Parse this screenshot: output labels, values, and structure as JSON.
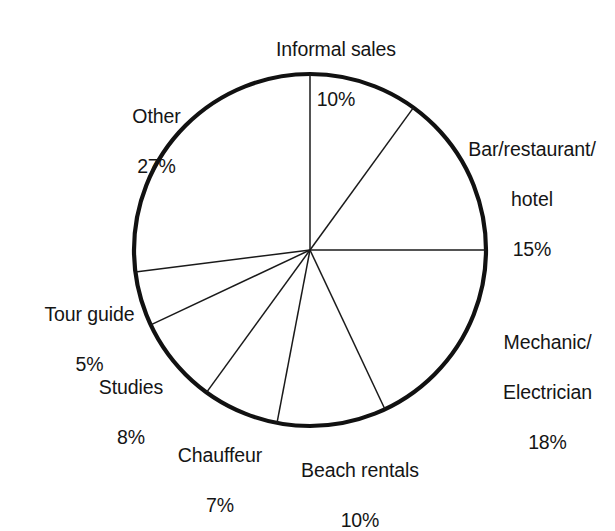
{
  "chart_data": {
    "type": "pie",
    "title": "",
    "subtitle": "",
    "xlabel": "",
    "ylabel": "",
    "legend_position": "none",
    "grid": false,
    "start_angle_deg": 0,
    "direction": "clockwise",
    "value_unit": "%",
    "categories": [
      "Informal sales",
      "Bar/restaurant/\nhotel",
      "Mechanic/\nElectrician",
      "Beach rentals",
      "Chauffeur",
      "Studies",
      "Tour guide",
      "Other"
    ],
    "values": [
      10,
      15,
      18,
      10,
      7,
      8,
      5,
      27
    ],
    "slices": [
      {
        "name": "Informal sales",
        "label_lines": [
          "Informal sales"
        ],
        "value": 10,
        "percent_text": "10%",
        "align": "center"
      },
      {
        "name": "Bar/restaurant/hotel",
        "label_lines": [
          "Bar/restaurant/",
          "hotel"
        ],
        "value": 15,
        "percent_text": "15%",
        "align": "center"
      },
      {
        "name": "Mechanic/Electrician",
        "label_lines": [
          "Mechanic/",
          "Electrician"
        ],
        "value": 18,
        "percent_text": "18%",
        "align": "center"
      },
      {
        "name": "Beach rentals",
        "label_lines": [
          "Beach rentals"
        ],
        "value": 10,
        "percent_text": "10%",
        "align": "center"
      },
      {
        "name": "Chauffeur",
        "label_lines": [
          "Chauffeur"
        ],
        "value": 7,
        "percent_text": "7%",
        "align": "center"
      },
      {
        "name": "Studies",
        "label_lines": [
          "Studies"
        ],
        "value": 8,
        "percent_text": "8%",
        "align": "center"
      },
      {
        "name": "Tour guide",
        "label_lines": [
          "Tour guide"
        ],
        "value": 5,
        "percent_text": "5%",
        "align": "center"
      },
      {
        "name": "Other",
        "label_lines": [
          "Other"
        ],
        "value": 27,
        "percent_text": "27%",
        "align": "center"
      }
    ],
    "geometry": {
      "center_x": 310,
      "center_y": 250,
      "radius": 176,
      "outline_color": "#111111",
      "spoke_color": "#1a1a1a",
      "fill_color": "#ffffff"
    }
  },
  "labels": {
    "informal_sales": {
      "name": "Informal sales",
      "pct": "10%"
    },
    "bar_restaurant": {
      "line1": "Bar/restaurant/",
      "line2": "hotel",
      "pct": "15%"
    },
    "mechanic": {
      "line1": "Mechanic/",
      "line2": "Electrician",
      "pct": "18%"
    },
    "beach_rentals": {
      "name": "Beach rentals",
      "pct": "10%"
    },
    "chauffeur": {
      "name": "Chauffeur",
      "pct": "7%"
    },
    "studies": {
      "name": "Studies",
      "pct": "8%"
    },
    "tour_guide": {
      "name": "Tour guide",
      "pct": "5%"
    },
    "other": {
      "name": "Other",
      "pct": "27%"
    }
  }
}
